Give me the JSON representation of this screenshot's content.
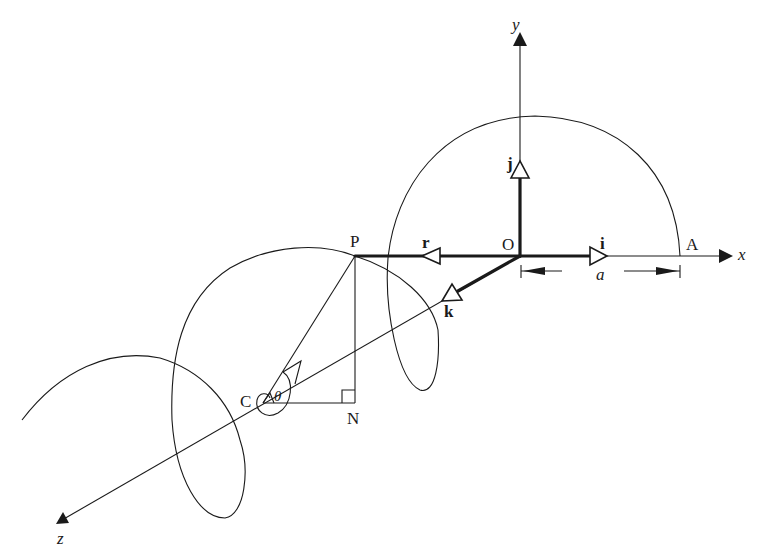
{
  "diagram": {
    "type": "3d-vector-helix",
    "axes": {
      "x": "x",
      "y": "y",
      "z": "z"
    },
    "points": {
      "origin": "O",
      "A": "A",
      "P": "P",
      "C": "C",
      "N": "N"
    },
    "unit_vectors": {
      "i": "i",
      "j": "j",
      "k": "k",
      "r": "r"
    },
    "angle": "θ",
    "dimension": "a",
    "colors": {
      "ink": "#1a1a1a",
      "background": "#ffffff"
    }
  }
}
